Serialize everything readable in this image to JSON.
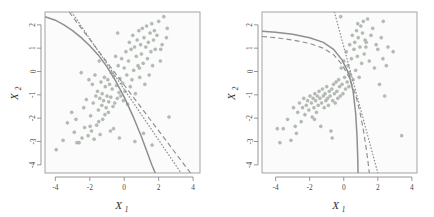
{
  "figure": {
    "title": "",
    "background_color": "#ffffff",
    "panel_background": "#fbfbfb",
    "point_color": "#b4bdb4",
    "line_color": "#8f8f8f"
  },
  "axis_titles": {
    "x_main": "X",
    "x_sub": "1",
    "y_main": "X",
    "y_sub": "2"
  },
  "chart_data": [
    {
      "type": "scatter",
      "panel": "left",
      "title": "",
      "xlabel": "X1",
      "ylabel": "X2",
      "xlim": [
        -4.6,
        4.4
      ],
      "ylim": [
        -4.35,
        2.55
      ],
      "xticks": [
        -4,
        -2,
        0,
        2,
        4
      ],
      "xticklabels": [
        "-4",
        "-2",
        "0",
        "2",
        "4"
      ],
      "yticks": [
        2,
        1,
        0,
        -1,
        -2,
        -3,
        -4
      ],
      "yticklabels": [
        "2",
        "1",
        "0",
        "-1",
        "-2",
        "-3",
        "-4"
      ],
      "grid": false,
      "legend": "none",
      "series": [
        {
          "name": "observations",
          "style": "points",
          "x": [
            -3.95,
            -3.55,
            -3.3,
            -3.05,
            -2.9,
            -2.8,
            -2.62,
            -2.5,
            -2.45,
            -2.35,
            -2.3,
            -2.2,
            -2.1,
            -2.05,
            -1.95,
            -1.9,
            -1.85,
            -1.8,
            -1.75,
            -1.7,
            -1.65,
            -1.6,
            -1.55,
            -1.5,
            -1.45,
            -1.42,
            -1.4,
            -1.35,
            -1.3,
            -1.28,
            -1.25,
            -1.2,
            -1.15,
            -1.12,
            -1.1,
            -1.05,
            -1.0,
            -0.95,
            -0.92,
            -0.9,
            -0.85,
            -0.8,
            -0.78,
            -0.75,
            -0.7,
            -0.65,
            -0.6,
            -0.55,
            -0.5,
            -0.45,
            -0.4,
            -0.35,
            -0.3,
            -0.28,
            -0.25,
            -0.2,
            -0.15,
            -0.1,
            -0.05,
            0.0,
            0.05,
            0.1,
            0.15,
            0.2,
            0.25,
            0.3,
            0.35,
            0.4,
            0.45,
            0.5,
            0.55,
            0.6,
            0.65,
            0.7,
            0.75,
            0.8,
            0.85,
            0.9,
            0.95,
            1.0,
            1.05,
            1.1,
            1.15,
            1.2,
            1.25,
            1.3,
            1.35,
            1.4,
            1.45,
            1.5,
            1.55,
            1.6,
            1.65,
            1.7,
            1.75,
            1.8,
            1.9,
            2.0,
            2.1,
            2.2,
            2.3,
            2.45,
            2.5,
            2.6,
            -2.75,
            -1.98,
            -0.62,
            0.62,
            1.12,
            1.62,
            2.12,
            -1.48,
            -0.38,
            0.88,
            1.38
          ],
          "y": [
            -3.35,
            -2.95,
            -2.2,
            -1.75,
            -2.6,
            -2.05,
            -3.05,
            -0.05,
            -2.85,
            -1.55,
            -2.4,
            -1.2,
            -2.75,
            -0.35,
            -1.9,
            -2.55,
            -0.55,
            -1.35,
            -2.9,
            -0.15,
            -1.05,
            -2.3,
            -0.85,
            -1.65,
            0.45,
            -1.15,
            -2.7,
            -0.45,
            -1.45,
            -0.95,
            -2.05,
            -1.25,
            -0.25,
            -1.85,
            -0.65,
            -1.55,
            -1.05,
            -0.35,
            -1.75,
            -1.3,
            -0.55,
            -2.55,
            -1.1,
            -0.05,
            -0.75,
            -1.5,
            -0.2,
            -1.35,
            0.65,
            -0.6,
            -1.15,
            0.25,
            -0.9,
            -2.85,
            -0.3,
            -1.05,
            0.55,
            -0.5,
            -1.25,
            0.15,
            -0.85,
            0.85,
            -0.15,
            -1.4,
            0.45,
            1.25,
            -0.65,
            0.95,
            -0.35,
            1.55,
            0.05,
            1.05,
            -0.95,
            0.65,
            1.35,
            0.25,
            1.75,
            -0.25,
            1.15,
            0.75,
            1.85,
            0.35,
            1.45,
            -0.55,
            1.05,
            1.95,
            0.55,
            1.25,
            -0.15,
            1.65,
            0.85,
            2.05,
            0.25,
            1.35,
            1.75,
            0.95,
            1.55,
            2.15,
            0.45,
            1.15,
            2.35,
            1.45,
            1.85,
            -1.95,
            -3.05,
            -2.35,
            -2.45,
            -3.0,
            -2.65,
            -3.15,
            0.95,
            -2.15,
            1.65,
            0.15
          ]
        },
        {
          "name": "bayes_boundary",
          "style": "solid",
          "description": "true quadratic Bayes decision boundary, concave curve from upper-left to lower-right",
          "points_x": [
            -4.6,
            -4.0,
            -3.5,
            -3.0,
            -2.5,
            -2.0,
            -1.5,
            -1.0,
            -0.5,
            0.0,
            0.5,
            1.0,
            1.3,
            1.6,
            1.8
          ],
          "points_y": [
            2.35,
            2.2,
            2.0,
            1.75,
            1.45,
            1.1,
            0.7,
            0.2,
            -0.4,
            -1.1,
            -1.9,
            -2.8,
            -3.4,
            -4.0,
            -4.35
          ]
        },
        {
          "name": "lda_boundary",
          "style": "dotted",
          "description": "LDA linear decision boundary",
          "points_x": [
            -3.05,
            3.3
          ],
          "points_y": [
            2.55,
            -4.35
          ]
        },
        {
          "name": "qda_boundary",
          "style": "dashed",
          "description": "QDA estimated boundary, near-linear",
          "points_x": [
            -3.2,
            3.85
          ],
          "points_y": [
            2.55,
            -4.35
          ]
        }
      ]
    },
    {
      "type": "scatter",
      "panel": "right",
      "title": "",
      "xlabel": "X1",
      "ylabel": "X2",
      "xlim": [
        -4.8,
        4.3
      ],
      "ylim": [
        -4.35,
        2.55
      ],
      "xticks": [
        -4,
        -2,
        0,
        2,
        4
      ],
      "xticklabels": [
        "-4",
        "-2",
        "0",
        "2",
        "4"
      ],
      "yticks": [
        2,
        1,
        0,
        -1,
        -2,
        -3,
        -4
      ],
      "yticklabels": [
        "2",
        "1",
        "0",
        "-1",
        "-2",
        "-3",
        "-4"
      ],
      "grid": false,
      "legend": "none",
      "series": [
        {
          "name": "observations",
          "style": "points",
          "x": [
            -3.75,
            -3.55,
            -3.3,
            -3.1,
            -2.95,
            -2.85,
            -2.7,
            -2.6,
            -2.5,
            -2.42,
            -2.35,
            -2.28,
            -2.2,
            -2.12,
            -2.05,
            -1.98,
            -1.9,
            -1.85,
            -1.8,
            -1.75,
            -1.7,
            -1.65,
            -1.6,
            -1.55,
            -1.5,
            -1.45,
            -1.4,
            -1.35,
            -1.3,
            -1.25,
            -1.2,
            -1.15,
            -1.1,
            -1.05,
            -1.0,
            -0.95,
            -0.9,
            -0.85,
            -0.8,
            -0.75,
            -0.7,
            -0.65,
            -0.6,
            -0.55,
            -0.5,
            -0.45,
            -0.4,
            -0.35,
            -0.3,
            -0.25,
            -0.2,
            -0.15,
            -0.1,
            -0.05,
            0.0,
            0.05,
            0.1,
            0.15,
            0.2,
            0.25,
            0.3,
            0.35,
            0.4,
            0.45,
            0.5,
            0.55,
            0.6,
            0.65,
            0.7,
            0.75,
            0.8,
            0.85,
            0.9,
            0.95,
            1.0,
            1.05,
            1.1,
            1.15,
            1.2,
            1.25,
            1.3,
            1.4,
            1.5,
            1.6,
            1.7,
            1.8,
            1.9,
            2.0,
            2.1,
            2.2,
            2.3,
            2.4,
            2.5,
            2.6,
            2.9,
            3.4,
            -3.9,
            -2.78,
            -1.72,
            -0.68,
            0.32,
            1.32,
            2.32,
            -0.18,
            0.82,
            1.82
          ],
          "y": [
            -3.05,
            -2.45,
            -2.05,
            -2.95,
            -1.55,
            -2.35,
            -1.75,
            -1.35,
            -2.15,
            -1.55,
            -1.15,
            -1.85,
            -1.45,
            -1.25,
            -1.65,
            -1.05,
            -1.35,
            -1.95,
            -1.15,
            -1.55,
            -0.95,
            -1.25,
            -1.75,
            -1.05,
            -1.45,
            -0.85,
            -1.15,
            -2.35,
            -1.35,
            -0.75,
            -1.05,
            -1.55,
            -0.95,
            -1.25,
            -0.65,
            -1.15,
            -1.45,
            -0.85,
            -1.05,
            -2.55,
            -0.75,
            -1.25,
            -0.55,
            -0.95,
            -1.35,
            -0.45,
            -0.85,
            -1.15,
            -0.35,
            -0.65,
            -1.05,
            0.15,
            -0.55,
            -0.95,
            0.45,
            -0.25,
            -0.75,
            0.85,
            -0.45,
            0.25,
            -0.65,
            1.15,
            -0.15,
            0.55,
            1.55,
            -0.35,
            0.95,
            1.25,
            0.05,
            1.75,
            0.65,
            1.45,
            -0.25,
            1.05,
            1.95,
            0.35,
            1.65,
            2.15,
            0.75,
            1.35,
            1.05,
            2.25,
            0.45,
            1.55,
            1.85,
            0.15,
            1.15,
            0.95,
            -0.55,
            1.45,
            0.55,
            -1.05,
            0.25,
            1.05,
            0.85,
            -2.75,
            -2.45,
            -2.65,
            -2.05,
            -2.85,
            -0.05,
            1.25,
            2.15,
            2.35,
            2.05
          ]
        },
        {
          "name": "bayes_boundary",
          "style": "solid",
          "description": "true quadratic Bayes boundary, hyperbola-like: flat top then steeply vertical",
          "points_x": [
            -4.8,
            -4.0,
            -3.0,
            -2.0,
            -1.2,
            -0.6,
            -0.1,
            0.3,
            0.55,
            0.7,
            0.78,
            0.82,
            0.84
          ],
          "points_y": [
            1.72,
            1.68,
            1.6,
            1.45,
            1.25,
            0.95,
            0.5,
            -0.1,
            -0.85,
            -1.8,
            -2.8,
            -3.7,
            -4.35
          ]
        },
        {
          "name": "qda_boundary",
          "style": "dashed",
          "description": "QDA estimated boundary, slightly below/right of Bayes",
          "points_x": [
            -4.8,
            -4.0,
            -3.0,
            -2.0,
            -1.2,
            -0.6,
            -0.1,
            0.35,
            0.7,
            0.95,
            1.15,
            1.3,
            1.42,
            1.5
          ],
          "points_y": [
            1.5,
            1.45,
            1.35,
            1.2,
            1.0,
            0.72,
            0.3,
            -0.3,
            -1.0,
            -1.75,
            -2.5,
            -3.2,
            -3.85,
            -4.35
          ]
        },
        {
          "name": "lda_boundary",
          "style": "dotted",
          "description": "LDA linear boundary, steep line from top to bottom-right",
          "points_x": [
            -0.55,
            2.0
          ],
          "points_y": [
            2.55,
            -4.35
          ]
        }
      ]
    }
  ]
}
